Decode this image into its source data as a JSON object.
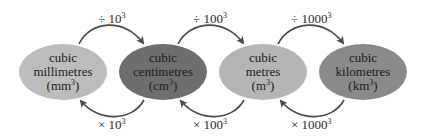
{
  "diagram": {
    "title": "",
    "nodes": [
      {
        "line1": "cubic",
        "line2": "millimetres",
        "unit_base": "(mm",
        "unit_exp": "3",
        "unit_close": ")",
        "color": "#bcbcbc"
      },
      {
        "line1": "cubic",
        "line2": "centimetres",
        "unit_base": "(cm",
        "unit_exp": "3",
        "unit_close": ")",
        "color": "#6e6e6e"
      },
      {
        "line1": "cubic",
        "line2": "metres",
        "unit_base": "(m",
        "unit_exp": "3",
        "unit_close": ")",
        "color": "#b5b5b5"
      },
      {
        "line1": "cubic",
        "line2": "kilometres",
        "unit_base": "(km",
        "unit_exp": "3",
        "unit_close": ")",
        "color": "#8a8a8a"
      }
    ],
    "divide_arrows": [
      {
        "op": "÷ ",
        "base": "10",
        "exp": "3"
      },
      {
        "op": "÷ ",
        "base": "100",
        "exp": "3"
      },
      {
        "op": "÷ ",
        "base": "1000",
        "exp": "3"
      }
    ],
    "multiply_arrows": [
      {
        "op": "× ",
        "base": "10",
        "exp": "3"
      },
      {
        "op": "× ",
        "base": "100",
        "exp": "3"
      },
      {
        "op": "× ",
        "base": "1000",
        "exp": "3"
      }
    ],
    "arrow_color": "#4a4a4a"
  }
}
